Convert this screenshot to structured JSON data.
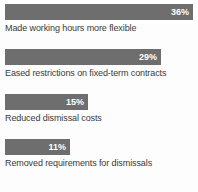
{
  "chart_data": {
    "type": "bar",
    "orientation": "horizontal",
    "title": "",
    "subtitle": "",
    "xlabel": "",
    "ylabel": "",
    "xlim": [
      0,
      38
    ],
    "grid": false,
    "legend": null,
    "value_suffix": "%",
    "categories": [
      "Made working hours more flexible",
      "Eased restrictions on fixed-term contracts",
      "Reduced dismissal costs",
      "Removed requirements for dismissals"
    ],
    "values": [
      36,
      29,
      15,
      11
    ],
    "value_labels": [
      "36%",
      "29%",
      "15%",
      "11%"
    ],
    "bars": [
      {
        "label": "Made working hours more flexible",
        "value": 36,
        "value_label": "36%",
        "bar_width_px": 188
      },
      {
        "label": "Eased restrictions on fixed-term contracts",
        "value": 29,
        "value_label": "29%",
        "bar_width_px": 156
      },
      {
        "label": "Reduced dismissal costs",
        "value": 15,
        "value_label": "15%",
        "bar_width_px": 83
      },
      {
        "label": "Removed requirements for dismissals",
        "value": 11,
        "value_label": "11%",
        "bar_width_px": 65
      }
    ],
    "colors": {
      "bar": "#6e6e6e",
      "value_text": "#ffffff",
      "category_text": "#3a3a3a",
      "background": "#fdfdfd"
    }
  }
}
